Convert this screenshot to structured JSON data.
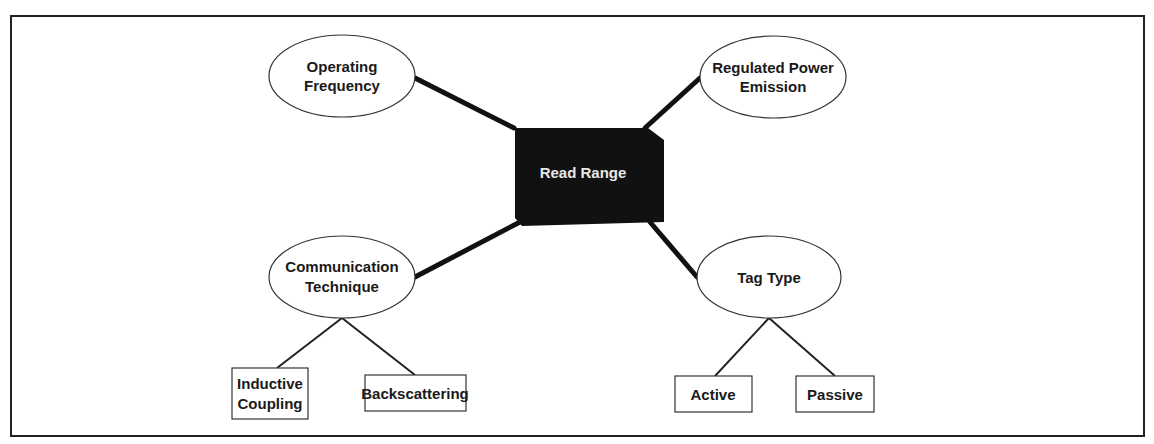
{
  "diagram": {
    "center": {
      "label": "Read Range",
      "fill": "#111111",
      "text_color": "#e8e8e8"
    },
    "factors": [
      {
        "id": "operating-frequency",
        "lines": [
          "Operating",
          "Frequency"
        ]
      },
      {
        "id": "regulated-power-emission",
        "lines": [
          "Regulated Power",
          "Emission"
        ]
      },
      {
        "id": "communication-technique",
        "lines": [
          "Communication",
          "Technique"
        ]
      },
      {
        "id": "tag-type",
        "lines": [
          "Tag Type"
        ]
      }
    ],
    "leaves": {
      "communication-technique": [
        {
          "lines": [
            "Inductive",
            "Coupling"
          ]
        },
        {
          "lines": [
            "Backscattering"
          ]
        }
      ],
      "tag-type": [
        {
          "lines": [
            "Active"
          ]
        },
        {
          "lines": [
            "Passive"
          ]
        }
      ]
    },
    "edges": [
      [
        "Read Range",
        "Operating Frequency"
      ],
      [
        "Read Range",
        "Regulated Power Emission"
      ],
      [
        "Read Range",
        "Communication Technique"
      ],
      [
        "Read Range",
        "Tag Type"
      ],
      [
        "Communication Technique",
        "Inductive Coupling"
      ],
      [
        "Communication Technique",
        "Backscattering"
      ],
      [
        "Tag Type",
        "Active"
      ],
      [
        "Tag Type",
        "Passive"
      ]
    ]
  }
}
